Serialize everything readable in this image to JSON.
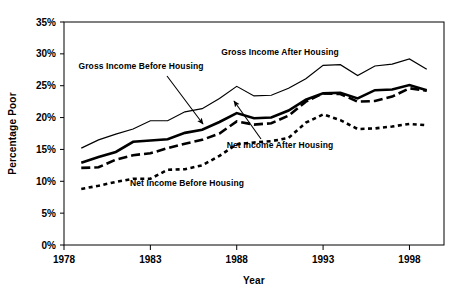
{
  "chart_data": {
    "type": "line",
    "title": "",
    "xlabel": "Year",
    "ylabel": "Percentage Poor",
    "xlim": [
      1978,
      2000
    ],
    "ylim": [
      0,
      35
    ],
    "grid": false,
    "legend_position": "inline-annotations",
    "x_ticks": [
      1978,
      1983,
      1988,
      1993,
      1998
    ],
    "x_tick_labels": [
      "1978",
      "1983",
      "1988",
      "1993",
      "1998"
    ],
    "y_ticks": [
      0,
      5,
      10,
      15,
      20,
      25,
      30,
      35
    ],
    "y_tick_labels": [
      "0%",
      "5%",
      "10%",
      "15%",
      "20%",
      "25%",
      "30%",
      "35%"
    ],
    "x": [
      1979,
      1980,
      1981,
      1982,
      1983,
      1984,
      1985,
      1986,
      1987,
      1988,
      1989,
      1990,
      1991,
      1992,
      1993,
      1994,
      1995,
      1996,
      1997,
      1998,
      1999
    ],
    "series": [
      {
        "name": "Gross Income After Housing",
        "style": "thin-solid",
        "color": "#000000",
        "values": [
          15.2,
          16.5,
          17.4,
          18.2,
          19.5,
          19.5,
          20.9,
          21.4,
          23.0,
          24.9,
          23.4,
          23.5,
          24.6,
          26.1,
          28.2,
          28.3,
          26.6,
          28.1,
          28.4,
          29.2,
          27.6
        ]
      },
      {
        "name": "Gross Income Before Housing",
        "style": "thick-solid",
        "color": "#000000",
        "values": [
          12.9,
          13.8,
          14.6,
          16.2,
          16.4,
          16.6,
          17.6,
          18.1,
          19.3,
          20.7,
          19.9,
          20.0,
          21.1,
          22.8,
          23.8,
          23.9,
          23.0,
          24.3,
          24.4,
          25.1,
          24.3
        ]
      },
      {
        "name": "Net Income After Housing",
        "style": "long-dash",
        "color": "#000000",
        "values": [
          12.1,
          12.2,
          13.4,
          14.1,
          14.4,
          15.2,
          15.9,
          16.5,
          17.5,
          19.4,
          18.9,
          19.1,
          20.3,
          22.5,
          23.8,
          23.7,
          22.5,
          22.6,
          23.3,
          24.6,
          24.2
        ]
      },
      {
        "name": "Net Income Before Housing",
        "style": "short-dash",
        "color": "#000000",
        "values": [
          8.8,
          9.3,
          9.9,
          10.4,
          10.4,
          11.8,
          11.9,
          12.5,
          14.0,
          15.8,
          16.1,
          16.3,
          16.8,
          19.2,
          20.5,
          19.6,
          18.2,
          18.3,
          18.6,
          19.0,
          18.8
        ]
      }
    ],
    "annotations": [
      {
        "text": "Gross Income Before Housing",
        "label_x": 141,
        "label_y": 69,
        "arrow_from_x": 167,
        "arrow_from_y": 76,
        "arrow_to_x": 203,
        "arrow_to_y": 124
      },
      {
        "text": "Gross Income After Housing",
        "label_x": 280,
        "label_y": 55,
        "arrow_from_x": null,
        "arrow_from_y": null,
        "arrow_to_x": null,
        "arrow_to_y": null
      },
      {
        "text": "Net Income After Housing",
        "label_x": 280,
        "label_y": 148,
        "arrow_from_x": 261,
        "arrow_from_y": 139,
        "arrow_to_x": 234,
        "arrow_to_y": 101
      },
      {
        "text": "Net Income Before Housing",
        "label_x": 187,
        "label_y": 186,
        "arrow_from_x": null,
        "arrow_from_y": null,
        "arrow_to_x": null,
        "arrow_to_y": null
      }
    ]
  }
}
